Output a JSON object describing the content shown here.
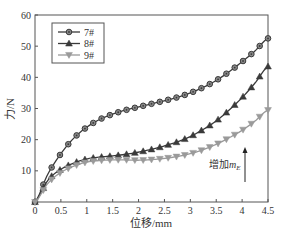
{
  "chart_data": {
    "type": "line",
    "title": "",
    "xlabel": "位移/mm",
    "ylabel": "力/N",
    "xlim": [
      0,
      4.5
    ],
    "ylim": [
      0,
      60
    ],
    "x_ticks": [
      "0",
      "0.5",
      "1",
      "1.5",
      "2",
      "2.5",
      "3",
      "3.5",
      "4",
      "4.5"
    ],
    "y_ticks": [
      "10",
      "20",
      "30",
      "40",
      "50",
      "60"
    ],
    "x_tick_values": [
      0,
      0.5,
      1,
      1.5,
      2,
      2.5,
      3,
      3.5,
      4,
      4.5
    ],
    "y_tick_values": [
      10,
      20,
      30,
      40,
      50,
      60
    ],
    "grid": false,
    "legend_position": "upper left",
    "annotation": {
      "text": "增加",
      "math_base": "m",
      "math_sub": "E",
      "arrow": "up"
    },
    "x": [
      0,
      0.25,
      0.5,
      0.75,
      1.0,
      1.25,
      1.5,
      1.75,
      2.0,
      2.25,
      2.5,
      2.75,
      3.0,
      3.25,
      3.5,
      3.75,
      4.0,
      4.25,
      4.5
    ],
    "series": [
      {
        "name": "7#",
        "color": "#3a3a3a",
        "marker": "circle",
        "values": [
          0,
          9,
          15.5,
          20.5,
          24,
          26.5,
          28.2,
          29.5,
          30.5,
          31.5,
          32.5,
          33.6,
          35,
          36.8,
          39,
          41.8,
          45,
          48.5,
          52.5
        ]
      },
      {
        "name": "8#",
        "color": "#3a3a3a",
        "marker": "triangle-up",
        "values": [
          0,
          7,
          10.5,
          12.5,
          13.8,
          14.4,
          14.8,
          15.3,
          16,
          16.9,
          18,
          19.3,
          21,
          23.3,
          26,
          29.5,
          33.5,
          38.2,
          43.5
        ]
      },
      {
        "name": "9#",
        "color": "#9a9a9a",
        "marker": "triangle-down",
        "values": [
          0,
          6,
          9.5,
          11.5,
          12.8,
          13.3,
          13.5,
          13.5,
          13.4,
          13.6,
          14,
          14.6,
          15.5,
          16.8,
          18.5,
          20.6,
          23,
          26,
          29.5
        ]
      }
    ]
  }
}
